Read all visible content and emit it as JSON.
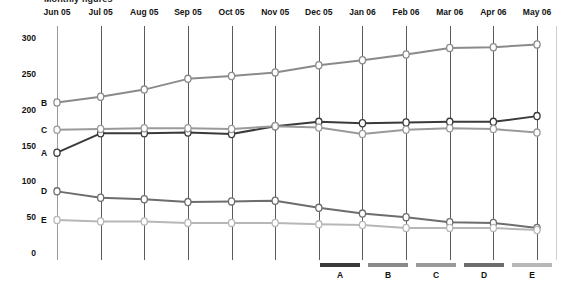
{
  "chart_data": {
    "type": "line",
    "title": "Monthly figures",
    "xlabel": "",
    "ylabel": "",
    "ylim": [
      0,
      300
    ],
    "yticks": [
      0,
      50,
      100,
      150,
      200,
      250,
      300
    ],
    "grid": "vertical",
    "legend_position": "bottom-right",
    "categories": [
      "Jun 05",
      "Jul 05",
      "Aug 05",
      "Sep 05",
      "Oct 05",
      "Nov 05",
      "Dec 05",
      "Jan 06",
      "Feb 06",
      "Mar 06",
      "Apr 06",
      "May 06"
    ],
    "series": [
      {
        "name": "A",
        "color": "#3a3a3a",
        "values": [
          140,
          167,
          167,
          168,
          166,
          177,
          183,
          181,
          182,
          183,
          183,
          191
        ]
      },
      {
        "name": "B",
        "color": "#8a8a8a",
        "values": [
          210,
          218,
          228,
          243,
          247,
          252,
          262,
          269,
          277,
          286,
          287,
          291
        ]
      },
      {
        "name": "C",
        "color": "#9a9a9a",
        "values": [
          172,
          173,
          174,
          174,
          173,
          177,
          175,
          166,
          172,
          174,
          173,
          168
        ]
      },
      {
        "name": "D",
        "color": "#6d6d6d",
        "values": [
          86,
          77,
          75,
          71,
          72,
          73,
          63,
          55,
          50,
          43,
          42,
          35
        ]
      },
      {
        "name": "E",
        "color": "#b7b7b7",
        "values": [
          46,
          44,
          44,
          42,
          42,
          42,
          40,
          39,
          35,
          35,
          35,
          32
        ]
      }
    ]
  },
  "axis": {
    "y_tick_labels": [
      "300",
      "250",
      "200",
      "150",
      "100",
      "50",
      "0"
    ]
  },
  "series_labels": [
    {
      "text": "B",
      "value": 210
    },
    {
      "text": "C",
      "value": 172
    },
    {
      "text": "A",
      "value": 140
    },
    {
      "text": "D",
      "value": 86
    },
    {
      "text": "E",
      "value": 46
    }
  ],
  "legend": {
    "items": [
      {
        "label": "A",
        "color": "#3a3a3a"
      },
      {
        "label": "B",
        "color": "#8a8a8a"
      },
      {
        "label": "C",
        "color": "#9a9a9a"
      },
      {
        "label": "D",
        "color": "#6d6d6d"
      },
      {
        "label": "E",
        "color": "#b7b7b7"
      }
    ]
  }
}
